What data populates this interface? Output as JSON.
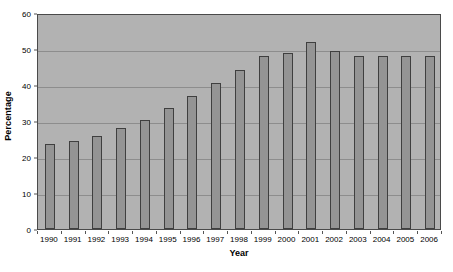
{
  "chart_data": {
    "type": "bar",
    "title": "",
    "subtitle": "",
    "xlabel": "Year",
    "ylabel": "Percentage",
    "categories": [
      "1990",
      "1991",
      "1992",
      "1993",
      "1994",
      "1995",
      "1996",
      "1997",
      "1998",
      "1999",
      "2000",
      "2001",
      "2002",
      "2003",
      "2004",
      "2005",
      "2006"
    ],
    "values": [
      23.5,
      24.5,
      25.8,
      28.0,
      30.2,
      33.5,
      37.0,
      40.5,
      44.3,
      48.0,
      49.0,
      52.0,
      49.5,
      48.0,
      48.0,
      48.0,
      48.0
    ],
    "series": [
      {
        "name": "Percentage",
        "values": [
          23.5,
          24.5,
          25.8,
          28.0,
          30.2,
          33.5,
          37.0,
          40.5,
          44.3,
          48.0,
          49.0,
          52.0,
          49.5,
          48.0,
          48.0,
          48.0,
          48.0
        ]
      }
    ],
    "ylim": [
      0,
      60
    ],
    "yticks": [
      0,
      10,
      20,
      30,
      40,
      50,
      60
    ],
    "ytick_labels": [
      "0",
      "10",
      "20",
      "30",
      "40",
      "50",
      "60"
    ],
    "grid": true,
    "grid_axis": "y",
    "legend": false,
    "legend_position": "none",
    "annotations": [],
    "colors": {
      "bar_fill": "#949494",
      "bar_border": "#3f3f3f",
      "plot_background": "#b2b2b2",
      "plot_border": "#4a4a4a",
      "gridline": "#8d8d8d",
      "text": "#000000",
      "page_background": "#ffffff"
    }
  }
}
